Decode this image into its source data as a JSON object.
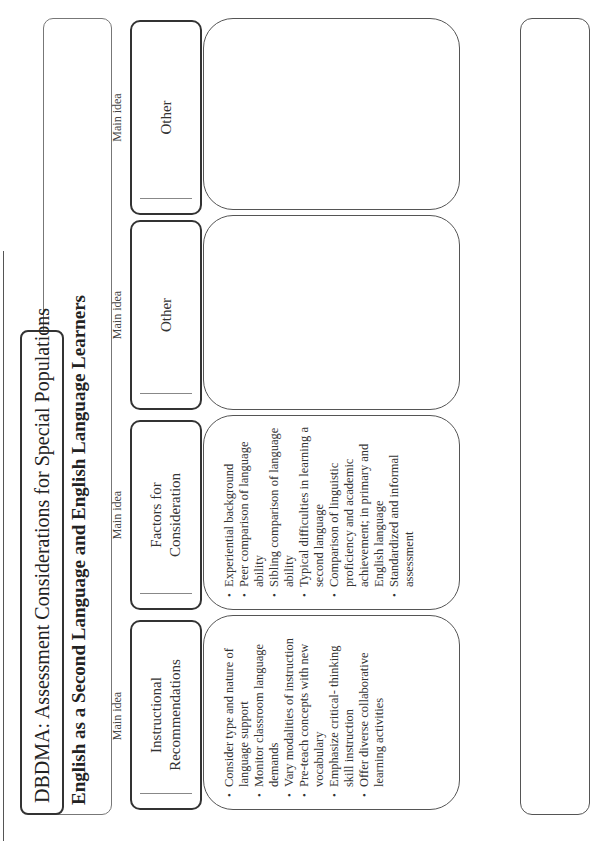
{
  "header": {
    "title": "DBDMA: Assessment Considerations for Special Populations",
    "subtitle": "English as a Second Language and English Language Learners"
  },
  "columns": [
    {
      "caption": "Main idea",
      "heading": "Instructional\nRecommendations",
      "items": [
        "Consider type and nature of language support",
        "Monitor classroom language demands",
        "Vary modalities of instruction",
        "Pre-teach concepts with new vocabulary",
        "Emphasize critical- thinking skill instruction",
        "Offer diverse collaborative learning activities"
      ]
    },
    {
      "caption": "Main idea",
      "heading": "Factors for\nConsideration",
      "items": [
        "Experiential background",
        "Peer comparison of language ability",
        "Sibling comparison of language ability",
        "Typical difficulties in learning a second language",
        "Comparison of linguistic proficiency and academic achievement; in primary and English language",
        "Standardized and informal assessment"
      ]
    },
    {
      "caption": "Main idea",
      "heading": "Other",
      "items": []
    },
    {
      "caption": "Main idea",
      "heading": "Other",
      "items": []
    }
  ]
}
